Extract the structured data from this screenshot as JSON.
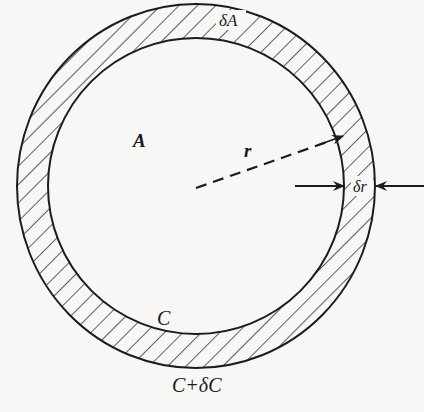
{
  "diagram": {
    "labels": {
      "ring_area": "δA",
      "inner_area": "A",
      "radius": "r",
      "thickness": "δr",
      "inner_perimeter": "C",
      "outer_perimeter": "C+δC"
    },
    "geometry": {
      "center": [
        196,
        186
      ],
      "inner_radius": 148,
      "outer_radius_x": 179,
      "outer_radius_y": 182,
      "hatch_spacing": 13,
      "hatch_angle_deg": 45
    },
    "colors": {
      "ink": "#1c1c1c",
      "background": "#f7f7f5"
    }
  }
}
